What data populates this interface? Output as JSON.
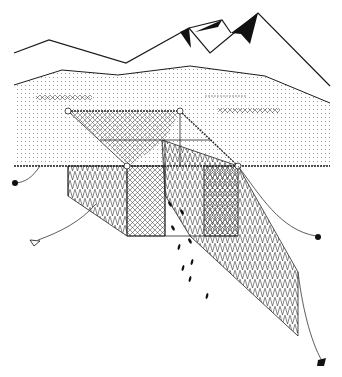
{
  "figure": {
    "width": 342,
    "height": 377,
    "elements": [
      "mountains",
      "far shore",
      "water surface",
      "trap net chamber",
      "leader net",
      "anchors",
      "fish"
    ]
  },
  "colors": {
    "background": "#ffffff",
    "ink": "#1a1a1a",
    "dots": "#9a9a9a",
    "mesh": "#333333"
  }
}
